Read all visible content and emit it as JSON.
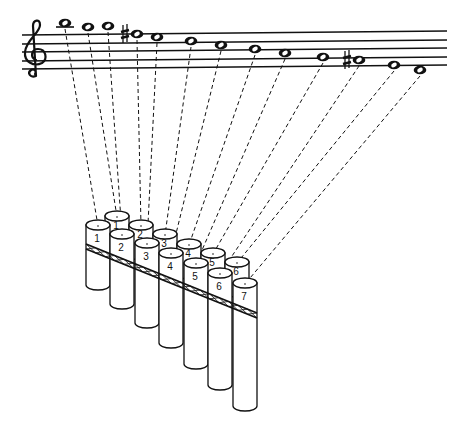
{
  "figure": {
    "clef": "treble",
    "ink_color": "#111111",
    "background": "#ffffff"
  },
  "staff": {
    "left_x": 22,
    "right_x": 447,
    "left_ys": [
      35,
      44,
      52,
      61,
      69
    ],
    "right_ys": [
      31,
      40,
      48,
      57,
      65
    ]
  },
  "notes": [
    {
      "x": 65,
      "y": 23,
      "ledger": true,
      "sharp": false,
      "pipe": "F1"
    },
    {
      "x": 88,
      "y": 27,
      "ledger": false,
      "sharp": false,
      "pipe": "B1"
    },
    {
      "x": 108,
      "y": 26,
      "ledger": false,
      "sharp": false,
      "pipe": "F2"
    },
    {
      "x": 137,
      "y": 34,
      "ledger": false,
      "sharp": true,
      "pipe": "B2"
    },
    {
      "x": 157,
      "y": 37,
      "ledger": false,
      "sharp": false,
      "pipe": "F3"
    },
    {
      "x": 191,
      "y": 41,
      "ledger": false,
      "sharp": false,
      "pipe": "B3"
    },
    {
      "x": 221,
      "y": 45,
      "ledger": false,
      "sharp": false,
      "pipe": "F4"
    },
    {
      "x": 255,
      "y": 49,
      "ledger": false,
      "sharp": false,
      "pipe": "B4"
    },
    {
      "x": 285,
      "y": 53,
      "ledger": false,
      "sharp": false,
      "pipe": "F5"
    },
    {
      "x": 323,
      "y": 57,
      "ledger": false,
      "sharp": false,
      "pipe": "B5"
    },
    {
      "x": 359,
      "y": 60,
      "ledger": false,
      "sharp": true,
      "pipe": "F6"
    },
    {
      "x": 394,
      "y": 65,
      "ledger": false,
      "sharp": false,
      "pipe": "B6"
    },
    {
      "x": 420,
      "y": 70,
      "ledger": false,
      "sharp": false,
      "pipe": "F7"
    }
  ],
  "pipes": {
    "front": [
      {
        "id": "F1",
        "label": "1",
        "cx": 98,
        "top": 225,
        "bottom": 285
      },
      {
        "id": "F2",
        "label": "2",
        "cx": 122,
        "top": 234,
        "bottom": 304
      },
      {
        "id": "F3",
        "label": "3",
        "cx": 147,
        "top": 243,
        "bottom": 323
      },
      {
        "id": "F4",
        "label": "4",
        "cx": 171,
        "top": 253,
        "bottom": 343
      },
      {
        "id": "F5",
        "label": "5",
        "cx": 196,
        "top": 263,
        "bottom": 364
      },
      {
        "id": "F6",
        "label": "6",
        "cx": 220,
        "top": 273,
        "bottom": 385
      },
      {
        "id": "F7",
        "label": "7",
        "cx": 245,
        "top": 283,
        "bottom": 406
      }
    ],
    "back": [
      {
        "id": "B1",
        "label": "1",
        "cx": 117,
        "top": 216
      },
      {
        "id": "B2",
        "label": "2",
        "cx": 141,
        "top": 225
      },
      {
        "id": "B3",
        "label": "3",
        "cx": 165,
        "top": 234
      },
      {
        "id": "B4",
        "label": "4",
        "cx": 189,
        "top": 244
      },
      {
        "id": "B5",
        "label": "5",
        "cx": 213,
        "top": 253
      },
      {
        "id": "B6",
        "label": "6",
        "cx": 237,
        "top": 262
      }
    ]
  },
  "band": {
    "x1": 86,
    "y1": 244,
    "x2": 257,
    "y2": 313
  }
}
